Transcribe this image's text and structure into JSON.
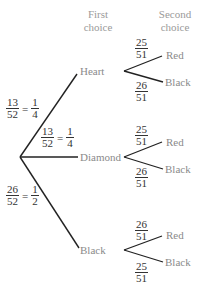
{
  "headers": {
    "first": [
      "First",
      "choice"
    ],
    "second": [
      "Second",
      "choice"
    ]
  },
  "colors": {
    "line": "#222222",
    "label": "#8a8a8a",
    "fraction": "#333333"
  },
  "root": {
    "x": 20,
    "y": 157
  },
  "first_choice": [
    {
      "label": "Heart",
      "prob_num": "13",
      "prob_den": "52",
      "simp_num": "1",
      "simp_den": "4",
      "second": [
        {
          "label": "Red",
          "num": "25",
          "den": "51"
        },
        {
          "label": "Black",
          "num": "26",
          "den": "51"
        }
      ]
    },
    {
      "label": "Diamond",
      "prob_num": "13",
      "prob_den": "52",
      "simp_num": "1",
      "simp_den": "4",
      "second": [
        {
          "label": "Red",
          "num": "25",
          "den": "51"
        },
        {
          "label": "Black",
          "num": "26",
          "den": "51"
        }
      ]
    },
    {
      "label": "Black",
      "prob_num": "26",
      "prob_den": "52",
      "simp_num": "1",
      "simp_den": "2",
      "second": [
        {
          "label": "Red",
          "num": "26",
          "den": "51"
        },
        {
          "label": "Black",
          "num": "25",
          "den": "51"
        }
      ]
    }
  ]
}
